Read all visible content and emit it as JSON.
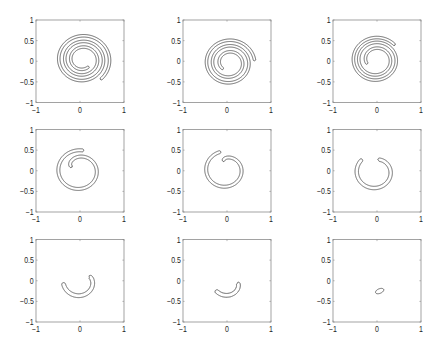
{
  "chart_data": {
    "type": "line",
    "title": "",
    "xlabel": "",
    "ylabel": "",
    "grid_on": false,
    "legend": null,
    "grid": {
      "rows": 3,
      "cols": 3
    },
    "axes": {
      "xlim": [
        -1,
        1
      ],
      "ylim": [
        -1,
        1
      ],
      "xtick_values": [
        -1,
        0,
        1
      ],
      "xtick_labels": [
        "−1",
        "0",
        "1"
      ],
      "ytick_values": [
        1,
        0.5,
        0,
        -0.5,
        -1
      ],
      "ytick_labels": [
        "1",
        "0.5",
        "0",
        "−0.5",
        "−1"
      ]
    },
    "style": {
      "axes_color": "#8c8c8c",
      "curve_color": "#3a3a3a",
      "text_color": "#1e1e1e"
    },
    "panels": [
      {
        "index": 1,
        "description": "thin closed band wound into a spiral, ~3 turns",
        "outer_end": [
          0.45,
          -0.46
        ],
        "inner_end": [
          0.27,
          -0.22
        ],
        "curve": {
          "shape": "spiral_band",
          "center": [
            0.06,
            0.04
          ],
          "r_inner": 0.22,
          "r_outer": 0.63,
          "turns": 3.0,
          "outer_end_angle_deg": -50,
          "band_width": 0.06,
          "radius_exponent": 1.0
        }
      },
      {
        "index": 2,
        "description": "spiral band, ~2.6 turns",
        "outer_end": [
          0.58,
          0.02
        ],
        "inner_end": [
          -0.1,
          -0.21
        ],
        "curve": {
          "shape": "spiral_band",
          "center": [
            0.05,
            -0.04
          ],
          "r_inner": 0.2,
          "r_outer": 0.58,
          "turns": 2.62,
          "outer_end_angle_deg": 5,
          "band_width": 0.06,
          "radius_exponent": 0.9
        }
      },
      {
        "index": 3,
        "description": "spiral band, ~2.5 turns",
        "outer_end": [
          0.41,
          0.4
        ],
        "inner_end": [
          -0.25,
          -0.06
        ],
        "curve": {
          "shape": "spiral_band",
          "center": [
            -0.02,
            0.03
          ],
          "r_inner": 0.22,
          "r_outer": 0.56,
          "turns": 2.46,
          "outer_end_angle_deg": 40,
          "band_width": 0.06,
          "radius_exponent": 0.8
        }
      },
      {
        "index": 4,
        "description": "spiral band, ~1.2 turns ('6' shape)",
        "outer_end": [
          0.11,
          0.52
        ],
        "inner_end": [
          -0.19,
          0.1
        ],
        "curve": {
          "shape": "spiral_band",
          "center": [
            -0.02,
            0.0
          ],
          "r_inner": 0.18,
          "r_outer": 0.5,
          "turns": 1.2,
          "outer_end_angle_deg": 78,
          "band_width": 0.07,
          "radius_exponent": 0.35
        }
      },
      {
        "index": 5,
        "description": "spiral band, ~1 turn with inner hook",
        "outer_end": [
          -0.14,
          0.46
        ],
        "inner_end": [
          -0.07,
          0.22
        ],
        "curve": {
          "shape": "spiral_band",
          "center": [
            -0.04,
            0.02
          ],
          "r_inner": 0.2,
          "r_outer": 0.45,
          "turns": 0.99,
          "outer_end_angle_deg": 103,
          "band_width": 0.07,
          "radius_exponent": 0.3
        }
      },
      {
        "index": 6,
        "description": "C-shaped band open at top",
        "outer_end": [
          -0.34,
          0.28
        ],
        "inner_end": [
          0.03,
          0.28
        ],
        "curve": {
          "shape": "spiral_band",
          "center": [
            -0.05,
            -0.03
          ],
          "r_inner": 0.3,
          "r_outer": 0.42,
          "turns": 0.84,
          "outer_end_angle_deg": 133,
          "band_width": 0.08,
          "radius_exponent": 0.5
        }
      },
      {
        "index": 7,
        "description": "U-shaped band",
        "outer_end": [
          -0.39,
          -0.03
        ],
        "inner_end": [
          0.22,
          0.13
        ],
        "curve": {
          "shape": "spiral_band",
          "center": [
            -0.01,
            -0.02
          ],
          "r_inner": 0.25,
          "r_outer": 0.37,
          "turns": 0.57,
          "outer_end_angle_deg": 184,
          "band_width": 0.09,
          "radius_exponent": 0.5
        }
      },
      {
        "index": 8,
        "description": "crescent band",
        "outer_end": [
          -0.26,
          -0.23
        ],
        "inner_end": [
          0.25,
          -0.05
        ],
        "curve": {
          "shape": "spiral_band",
          "center": [
            0.02,
            -0.05
          ],
          "r_inner": 0.22,
          "r_outer": 0.33,
          "turns": 0.41,
          "outer_end_angle_deg": 213,
          "band_width": 0.09,
          "radius_exponent": 0.6
        }
      },
      {
        "index": 9,
        "description": "small tilted ellipse",
        "curve": {
          "shape": "ellipse",
          "center": [
            0.06,
            -0.25
          ],
          "semi_axes": [
            0.1,
            0.055
          ],
          "rotation_deg": 25
        }
      }
    ]
  }
}
